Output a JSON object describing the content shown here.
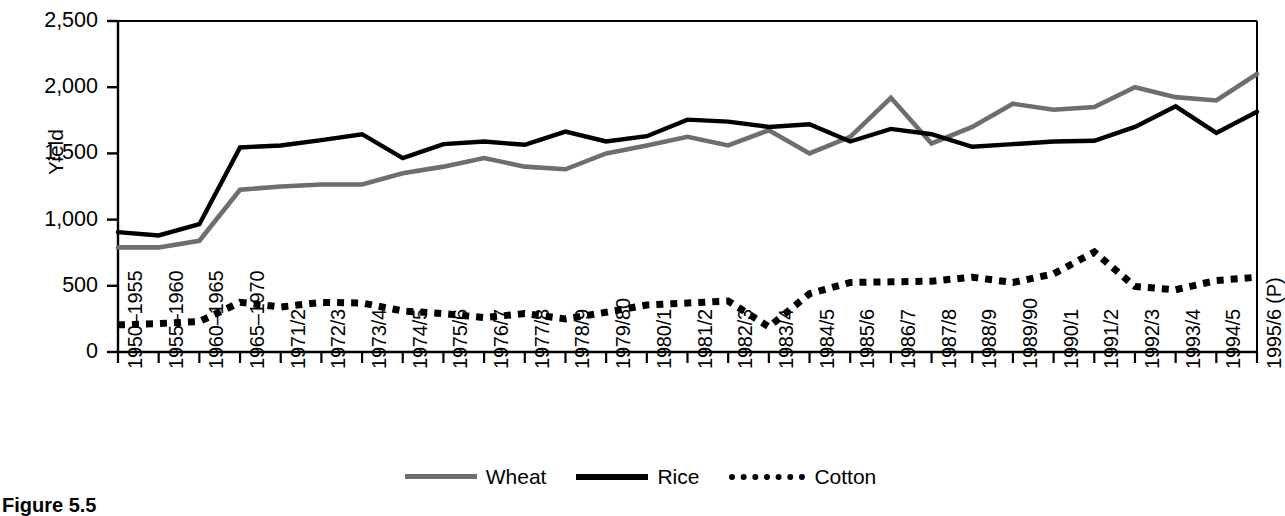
{
  "caption": "Figure 5.5",
  "chart_data": {
    "type": "line",
    "title": "",
    "xlabel": "",
    "ylabel": "Yield",
    "ylim": [
      0,
      2500
    ],
    "yticks": [
      0,
      500,
      1000,
      1500,
      2000,
      2500
    ],
    "ytick_labels": [
      "0",
      "500",
      "1,000",
      "1,500",
      "2,000",
      "2,500"
    ],
    "grid": false,
    "legend_position": "bottom-center",
    "categories": [
      "1950–1955",
      "1955–1960",
      "1960–1965",
      "1965–1970",
      "1971/2",
      "1972/3",
      "1973/4",
      "1974/5",
      "1975/6",
      "1976/7",
      "1977/8",
      "1978/9",
      "1979/80",
      "1980/1",
      "1981/2",
      "1982/3",
      "1983/4",
      "1984/5",
      "1985/6",
      "1986/7",
      "1987/8",
      "1988/9",
      "1989/90",
      "1990/1",
      "1991/2",
      "1992/3",
      "1993/4",
      "1994/5",
      "1995/6 (P)"
    ],
    "series": [
      {
        "name": "Wheat",
        "color": "#6e6e6e",
        "style": "solid",
        "values": [
          790,
          790,
          840,
          1225,
          1250,
          1265,
          1265,
          1350,
          1400,
          1465,
          1400,
          1380,
          1500,
          1560,
          1625,
          1560,
          1675,
          1500,
          1625,
          1920,
          1575,
          1700,
          1875,
          1830,
          1850,
          2000,
          1925,
          1900,
          2100
        ]
      },
      {
        "name": "Rice",
        "color": "#000000",
        "style": "solid",
        "values": [
          905,
          880,
          965,
          1545,
          1560,
          1600,
          1645,
          1465,
          1570,
          1590,
          1565,
          1665,
          1590,
          1630,
          1755,
          1740,
          1700,
          1720,
          1590,
          1685,
          1645,
          1550,
          1570,
          1590,
          1595,
          1700,
          1855,
          1655,
          1815
        ]
      },
      {
        "name": "Cotton",
        "color": "#000000",
        "style": "dotted",
        "values": [
          205,
          215,
          230,
          375,
          340,
          375,
          370,
          310,
          290,
          260,
          290,
          250,
          300,
          355,
          370,
          385,
          190,
          440,
          525,
          530,
          535,
          565,
          525,
          590,
          755,
          495,
          470,
          540,
          565
        ]
      }
    ]
  },
  "legend": {
    "items": [
      {
        "label": "Wheat",
        "swatch": "line-gray-solid"
      },
      {
        "label": "Rice",
        "swatch": "line-black-solid"
      },
      {
        "label": "Cotton",
        "swatch": "line-black-dotted"
      }
    ]
  }
}
